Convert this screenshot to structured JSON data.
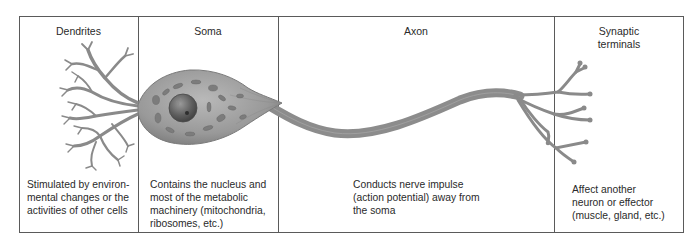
{
  "figure": {
    "columns": [
      {
        "id": "dendrites",
        "title": "Dendrites",
        "description_lines": [
          "Stimulated by environ-",
          "mental changes or the",
          "activities of other cells"
        ]
      },
      {
        "id": "soma",
        "title": "Soma",
        "description_lines": [
          "Contains the nucleus and",
          "most of the metabolic",
          "machinery (mitochondria,",
          "ribosomes, etc.)"
        ]
      },
      {
        "id": "axon",
        "title": "Axon",
        "description_lines": [
          "Conducts nerve impulse",
          "(action potential) away from",
          "the soma"
        ]
      },
      {
        "id": "synaptic-terminals",
        "title_lines": [
          "Synaptic",
          "terminals"
        ],
        "description_lines": [
          "Affect another",
          "neuron or effector",
          "(muscle, gland, etc.)"
        ]
      }
    ],
    "colors": {
      "border": "#5a5a5a",
      "neuron_fill": "#8e8e8e",
      "neuron_stroke": "#6e6e6e",
      "nucleus": "#5a5a5a",
      "organelle": "#7a7a7a"
    }
  }
}
